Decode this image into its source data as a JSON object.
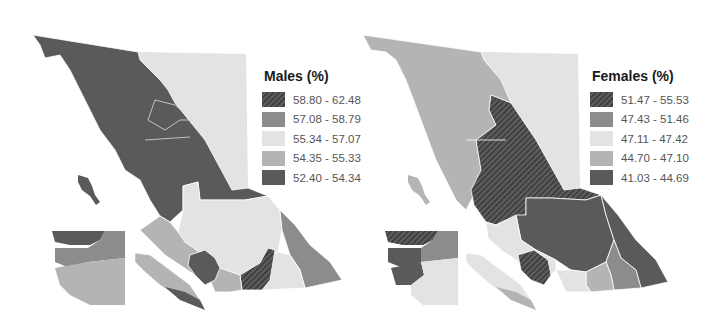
{
  "maps": [
    {
      "title": "Males (%)",
      "legend": [
        {
          "range": "58.80 - 62.48",
          "color": "#4f4f4f",
          "pattern": "hatch"
        },
        {
          "range": "57.08 - 58.79",
          "color": "#8c8c8c",
          "pattern": "solid"
        },
        {
          "range": "55.34 - 57.07",
          "color": "#e3e3e3",
          "pattern": "solid"
        },
        {
          "range": "54.35 - 55.33",
          "color": "#b4b4b4",
          "pattern": "solid"
        },
        {
          "range": "52.40 - 54.34",
          "color": "#5a5a5a",
          "pattern": "solid"
        }
      ]
    },
    {
      "title": "Females (%)",
      "legend": [
        {
          "range": "51.47 - 55.53",
          "color": "#4f4f4f",
          "pattern": "hatch"
        },
        {
          "range": "47.43 - 51.46",
          "color": "#8c8c8c",
          "pattern": "solid"
        },
        {
          "range": "47.11 - 47.42",
          "color": "#e3e3e3",
          "pattern": "solid"
        },
        {
          "range": "44.70 - 47.10",
          "color": "#b4b4b4",
          "pattern": "solid"
        },
        {
          "range": "41.03 - 44.69",
          "color": "#5a5a5a",
          "pattern": "solid"
        }
      ]
    }
  ]
}
